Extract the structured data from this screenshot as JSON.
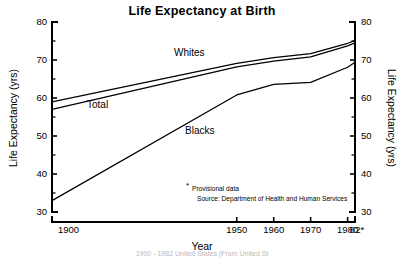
{
  "chart_data": {
    "type": "line",
    "title": "Life Expectancy at Birth",
    "xlabel": "Year",
    "ylabel": "Life Expectancy (yrs)",
    "ylabel_right": "Life Expectancy (yrs)",
    "x": [
      1900,
      1950,
      1960,
      1970,
      1980,
      1982
    ],
    "xtick_labels": [
      "1900",
      "1950",
      "1960",
      "1970",
      "1980",
      "82*"
    ],
    "xlim": [
      1900,
      1982
    ],
    "ylim": [
      30,
      80
    ],
    "ytick_labels": [
      "30",
      "40",
      "50",
      "60",
      "70",
      "80"
    ],
    "ytick_values": [
      30,
      40,
      50,
      60,
      70,
      80
    ],
    "yminor_values": [
      35,
      45,
      55,
      65,
      75
    ],
    "grid": false,
    "legend": "inline-labels",
    "series": [
      {
        "name": "Whites",
        "label": "Whites",
        "values": [
          59.0,
          69.1,
          70.6,
          71.7,
          74.4,
          75.1
        ]
      },
      {
        "name": "Total",
        "label": "Total",
        "values": [
          57.0,
          68.2,
          69.7,
          70.8,
          73.7,
          74.5
        ]
      },
      {
        "name": "Blacks",
        "label": "Blacks",
        "values": [
          33.0,
          60.8,
          63.6,
          64.1,
          68.1,
          69.4
        ]
      }
    ],
    "annotations": {
      "star": "*",
      "provisional": "Provisional data",
      "source": "Source: Department of Health and Human Services"
    }
  },
  "colors": {
    "line": "#000000",
    "text": "#000000",
    "background": "#ffffff",
    "caption": "#b9b9b9"
  },
  "caption": {
    "text": "1900 - 1982 United States (From United St"
  }
}
